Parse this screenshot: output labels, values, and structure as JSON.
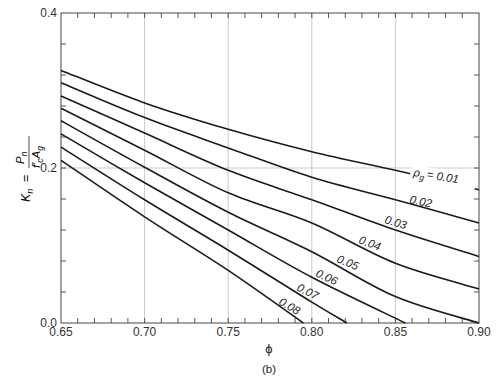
{
  "chart_data": {
    "type": "line",
    "title": "",
    "caption": "(b)",
    "xlabel": "ϕ",
    "ylabel": "K_n = P_n / (f'_c A_g)",
    "xlim": [
      0.65,
      0.9
    ],
    "ylim": [
      0.0,
      0.4
    ],
    "x_ticks": [
      "0.65",
      "0.70",
      "0.75",
      "0.80",
      "0.85",
      "0.90"
    ],
    "y_ticks": [
      "0.0",
      "0.2",
      "0.4"
    ],
    "grid": {
      "x": [
        0.7,
        0.75,
        0.8,
        0.85
      ],
      "y": [
        0.2
      ]
    },
    "legend": "inline labels on curves",
    "series": [
      {
        "name": "ρg = 0.01",
        "label": "ρg = 0.01",
        "x": [
          0.65,
          0.7,
          0.75,
          0.8,
          0.85,
          0.9
        ],
        "values": [
          0.326,
          0.284,
          0.25,
          0.221,
          0.197,
          0.172
        ]
      },
      {
        "name": "0.02",
        "label": "0.02",
        "x": [
          0.65,
          0.7,
          0.75,
          0.8,
          0.85,
          0.9
        ],
        "values": [
          0.31,
          0.265,
          0.226,
          0.188,
          0.159,
          0.129
        ]
      },
      {
        "name": "0.03",
        "label": "0.03",
        "x": [
          0.65,
          0.7,
          0.75,
          0.8,
          0.85,
          0.9
        ],
        "values": [
          0.293,
          0.245,
          0.197,
          0.159,
          0.12,
          0.086
        ]
      },
      {
        "name": "0.04",
        "label": "0.04",
        "x": [
          0.65,
          0.7,
          0.75,
          0.8,
          0.85,
          0.9
        ],
        "values": [
          0.277,
          0.223,
          0.168,
          0.129,
          0.077,
          0.044
        ]
      },
      {
        "name": "0.05",
        "label": "0.05",
        "x": [
          0.65,
          0.7,
          0.75,
          0.8,
          0.85,
          0.9
        ],
        "values": [
          0.261,
          0.201,
          0.143,
          0.092,
          0.034,
          0.0
        ]
      },
      {
        "name": "0.06",
        "label": "0.06",
        "x": [
          0.65,
          0.7,
          0.75,
          0.8,
          0.856
        ],
        "values": [
          0.244,
          0.181,
          0.12,
          0.059,
          0.0
        ]
      },
      {
        "name": "0.07",
        "label": "0.07",
        "x": [
          0.65,
          0.7,
          0.75,
          0.8,
          0.821
        ],
        "values": [
          0.227,
          0.159,
          0.094,
          0.027,
          0.0
        ]
      },
      {
        "name": "0.08",
        "label": "0.08",
        "x": [
          0.65,
          0.7,
          0.75,
          0.795
        ],
        "values": [
          0.21,
          0.137,
          0.068,
          0.0
        ]
      }
    ]
  },
  "labels": {
    "x_axis": "ϕ",
    "caption": "(b)",
    "y_axis_lhs": "K",
    "y_axis_lhs_sub": "n",
    "y_axis_eq": "=",
    "y_axis_num": "P",
    "y_axis_num_sub": "n",
    "y_axis_den": "f′",
    "y_axis_den_sub": "c",
    "y_axis_den2": "A",
    "y_axis_den2_sub": "g",
    "rho_prefix": "ρ",
    "rho_sub": "g",
    "rho_eq": "= 0.01",
    "curve_02": "0.02",
    "curve_03": "0.03",
    "curve_04": "0.04",
    "curve_05": "0.05",
    "curve_06": "0.06",
    "curve_07": "0.07",
    "curve_08": "0.08"
  },
  "ticks": {
    "x": [
      "0.65",
      "0.70",
      "0.75",
      "0.80",
      "0.85",
      "0.90"
    ],
    "y": [
      "0.0",
      "0.2",
      "0.4"
    ]
  }
}
